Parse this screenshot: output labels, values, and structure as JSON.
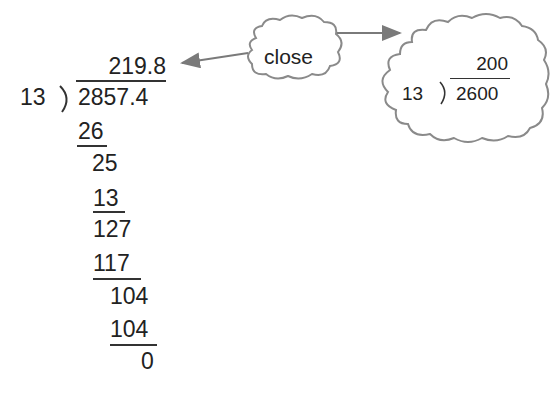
{
  "main_division": {
    "divisor": "13",
    "dividend": "2857.4",
    "quotient": "219.8",
    "steps": [
      {
        "value": "26",
        "kind": "subtract"
      },
      {
        "value": "25",
        "kind": "remainder"
      },
      {
        "value": "13",
        "kind": "subtract"
      },
      {
        "value": "127",
        "kind": "remainder"
      },
      {
        "value": "117",
        "kind": "subtract"
      },
      {
        "value": "104",
        "kind": "remainder"
      },
      {
        "value": "104",
        "kind": "subtract"
      },
      {
        "value": "0",
        "kind": "remainder"
      }
    ]
  },
  "callout_small": {
    "label": "close"
  },
  "callout_large": {
    "divisor": "13",
    "dividend": "2600",
    "quotient": "200"
  },
  "colors": {
    "text": "#222222",
    "arrow": "#7a7a7a",
    "cloud_stroke": "#8a8a8a"
  }
}
